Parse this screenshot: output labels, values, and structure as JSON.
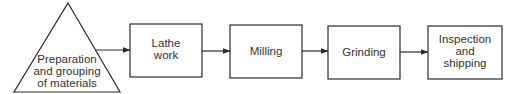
{
  "diagram": {
    "type": "flowchart",
    "colors": {
      "stroke": "#2b2b2b",
      "text": "#333333",
      "background": "#ffffff"
    },
    "start": {
      "shape": "triangle",
      "lines": [
        "Preparation",
        "and grouping",
        "of materials"
      ]
    },
    "steps": [
      {
        "id": "lathe",
        "lines": [
          "Lathe",
          "work"
        ]
      },
      {
        "id": "milling",
        "lines": [
          "Milling"
        ]
      },
      {
        "id": "grinding",
        "lines": [
          "Grinding"
        ]
      },
      {
        "id": "inspection",
        "lines": [
          "Inspection",
          "and",
          "shipping"
        ]
      }
    ],
    "edges": [
      {
        "from": "start",
        "to": "lathe"
      },
      {
        "from": "lathe",
        "to": "milling"
      },
      {
        "from": "milling",
        "to": "grinding"
      },
      {
        "from": "grinding",
        "to": "inspection"
      }
    ]
  }
}
